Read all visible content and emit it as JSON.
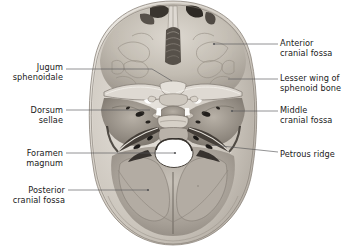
{
  "figure": {
    "background_color": "#ffffff",
    "leader_color": "#58585a",
    "text_color": "#1a1a1a"
  },
  "specimen": {
    "name": "dried-skull-base-photograph",
    "description": "Grayscale photograph of the internal surface of the cranial base",
    "bone_light": "#cfc9c0",
    "bone_mid": "#a79f96",
    "bone_dark": "#6e675f",
    "cavity_dark": "#2b2724",
    "foramen_magnum_fill": "#ffffff"
  },
  "labels": [
    {
      "id": "jugum-sphenoidale",
      "text": "Jugum\nsphenoidale",
      "side": "left",
      "text_x": 3,
      "text_y": 62,
      "text_width": 60
    },
    {
      "id": "dorsum-sellae",
      "text": "Dorsum\nsellae",
      "side": "left",
      "text_x": 3,
      "text_y": 105,
      "text_width": 60
    },
    {
      "id": "foramen-magnum",
      "text": "Foramen\nmagnum",
      "side": "left",
      "text_x": 3,
      "text_y": 148,
      "text_width": 60
    },
    {
      "id": "posterior-cranial-fossa",
      "text": "Posterior\ncranial fossa",
      "side": "left",
      "text_x": 3,
      "text_y": 185,
      "text_width": 62
    },
    {
      "id": "anterior-cranial-fossa",
      "text": "Anterior\ncranial fossa",
      "side": "right",
      "text_x": 280,
      "text_y": 38,
      "text_width": 66
    },
    {
      "id": "lesser-wing-of-sphenoid-bone",
      "text": "Lesser wing of\nsphenoid bone",
      "side": "right",
      "text_x": 280,
      "text_y": 73,
      "text_width": 66
    },
    {
      "id": "middle-cranial-fossa",
      "text": "Middle\ncranial fossa",
      "side": "right",
      "text_x": 280,
      "text_y": 105,
      "text_width": 66
    },
    {
      "id": "petrous-ridge",
      "text": "Petrous ridge",
      "side": "right",
      "text_x": 280,
      "text_y": 149,
      "text_width": 66
    }
  ],
  "leader_lines": [
    {
      "id": "leader-jugum-sphenoidale",
      "points": "66,69 152,69 172,81",
      "dot": null
    },
    {
      "id": "leader-dorsum-sellae",
      "points": "66,110 150,110",
      "dot": null
    },
    {
      "id": "leader-foramen-magnum",
      "points": "66,153 175,153",
      "dot": "175,153"
    },
    {
      "id": "leader-posterior-cranial-fossa",
      "points": "68,190 148,190",
      "dot": "148,190"
    },
    {
      "id": "leader-anterior-cranial-fossa",
      "points": "278,44 214,44",
      "dot": "214,44"
    },
    {
      "id": "leader-lesser-wing",
      "points": "278,79 228,79",
      "dot": null
    },
    {
      "id": "leader-middle-cranial-fossa",
      "points": "278,111 232,111",
      "dot": "232,111"
    },
    {
      "id": "leader-petrous-ridge",
      "points": "278,152 212,145",
      "dot": null
    }
  ]
}
